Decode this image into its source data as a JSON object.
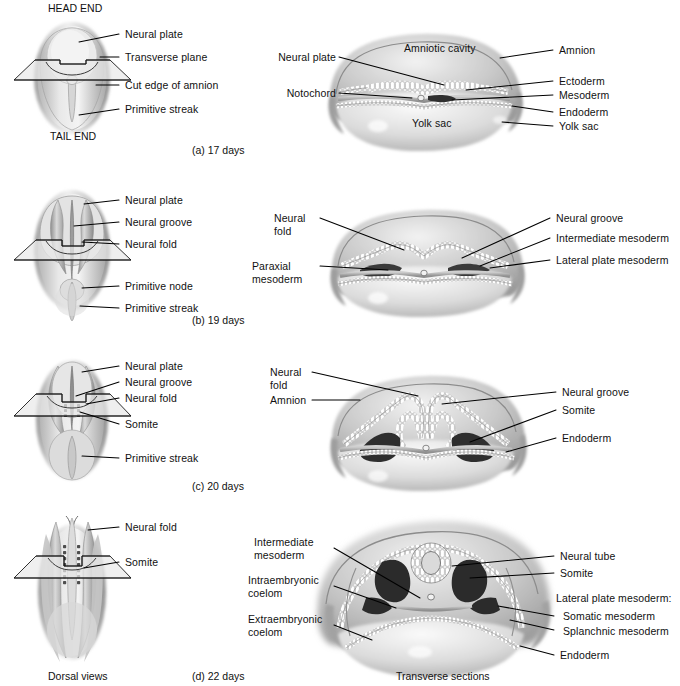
{
  "figure": {
    "column_captions": {
      "left": "Dorsal views",
      "right": "Transverse sections"
    },
    "orientation_labels": {
      "head": "HEAD END",
      "tail": "TAIL END"
    },
    "panels": [
      {
        "id": "a",
        "caption": "(a) 17 days",
        "dorsal_labels": [
          "Neural plate",
          "Transverse plane",
          "Cut edge of amnion",
          "Primitive streak"
        ],
        "section_labels_left": [
          "Neural plate",
          "Notochord"
        ],
        "section_labels_inner": [
          "Amniotic cavity",
          "Yolk sac"
        ],
        "section_labels_right": [
          "Amnion",
          "Ectoderm",
          "Mesoderm",
          "Endoderm",
          "Yolk sac"
        ]
      },
      {
        "id": "b",
        "caption": "(b) 19 days",
        "dorsal_labels": [
          "Neural plate",
          "Neural groove",
          "Neural fold",
          "Primitive node",
          "Primitive streak"
        ],
        "section_labels_left": [
          "Neural\nfold",
          "Paraxial\nmesoderm"
        ],
        "section_labels_inner": [],
        "section_labels_right": [
          "Neural groove",
          "Intermediate mesoderm",
          "Lateral plate mesoderm"
        ]
      },
      {
        "id": "c",
        "caption": "(c) 20 days",
        "dorsal_labels": [
          "Neural plate",
          "Neural groove",
          "Neural fold",
          "Somite",
          "Primitive streak"
        ],
        "section_labels_left": [
          "Neural\nfold",
          "Amnion"
        ],
        "section_labels_inner": [],
        "section_labels_right": [
          "Neural groove",
          "Somite",
          "Endoderm"
        ]
      },
      {
        "id": "d",
        "caption": "(d) 22 days",
        "dorsal_labels": [
          "Neural fold",
          "Somite"
        ],
        "section_labels_left": [
          "Intermediate\nmesoderm",
          "Intraembryonic\ncoelom",
          "Extraembryonic\ncoelom"
        ],
        "section_labels_inner": [],
        "section_labels_right": [
          "Neural tube",
          "Somite",
          "Lateral plate mesoderm:",
          "Somatic mesoderm",
          "Splanchnic mesoderm",
          "Endoderm"
        ]
      }
    ]
  },
  "colors": {
    "background": "#ffffff",
    "ink": "#000000",
    "tissue_light": "#d8d8d8",
    "tissue_mid": "#a8a8a8",
    "tissue_dark": "#4a4a4a",
    "cavity": "#2b2b2b",
    "plane_fill": "#e9e9e9"
  }
}
